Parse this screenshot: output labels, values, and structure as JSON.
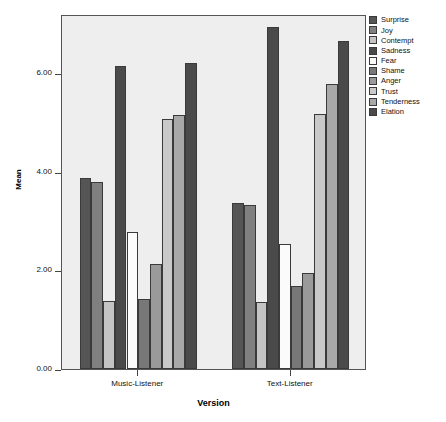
{
  "chart_data": {
    "type": "bar",
    "title": "",
    "xlabel": "Version",
    "ylabel": "Mean",
    "categories": [
      "Music-Listener",
      "Text-Listener"
    ],
    "ylim": [
      0,
      7.2
    ],
    "yticks": [
      0,
      2,
      4,
      6
    ],
    "ytick_labels": [
      "0.00",
      "2.00",
      "4.00",
      "6.00"
    ],
    "grid": false,
    "legend_position": "right",
    "series": [
      {
        "name": "Surprise",
        "color": "#555555",
        "values": [
          3.87,
          3.37
        ]
      },
      {
        "name": "Joy",
        "color": "#808080",
        "values": [
          3.8,
          3.32
        ]
      },
      {
        "name": "Contempt",
        "color": "#c4c4c4",
        "values": [
          1.38,
          1.35
        ]
      },
      {
        "name": "Sadness",
        "color": "#4a4a4a",
        "values": [
          6.15,
          6.93
        ]
      },
      {
        "name": "Fear",
        "color": "#fbfbfb",
        "values": [
          2.78,
          2.53
        ]
      },
      {
        "name": "Shame",
        "color": "#787878",
        "values": [
          1.42,
          1.68
        ]
      },
      {
        "name": "Anger",
        "color": "#9a9a9a",
        "values": [
          2.12,
          1.95
        ]
      },
      {
        "name": "Trust",
        "color": "#c9c9c9",
        "values": [
          5.08,
          5.17
        ]
      },
      {
        "name": "Tenderness",
        "color": "#a8a8a8",
        "values": [
          5.15,
          5.78
        ]
      },
      {
        "name": "Elation",
        "color": "#4a4a4a",
        "values": [
          6.2,
          6.65
        ]
      }
    ]
  },
  "axes": {
    "y_label": "Mean",
    "x_label": "Version"
  },
  "colors": {
    "plot_background": "#eeeeee",
    "plot_border": "#555555",
    "page_background": "#ffffff",
    "text": "#111111"
  }
}
